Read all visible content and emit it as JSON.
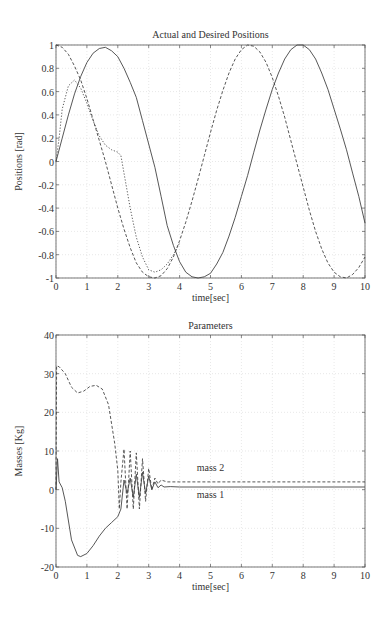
{
  "chart_data": [
    {
      "type": "line",
      "title": "Actual and Desired Positions",
      "xlabel": "time[sec]",
      "ylabel": "Positions [rad]",
      "xlim": [
        0,
        10
      ],
      "ylim": [
        -1,
        1
      ],
      "xticks": [
        "0",
        "1",
        "2",
        "3",
        "4",
        "5",
        "6",
        "7",
        "8",
        "9",
        "10"
      ],
      "yticks": [
        "-1",
        "-0.8",
        "-0.6",
        "-0.4",
        "-0.2",
        "0",
        "0.2",
        "0.4",
        "0.6",
        "0.8",
        "1"
      ],
      "grid": true,
      "series": [
        {
          "name": "actual position 1",
          "style": "solid",
          "x": [
            0,
            0.2,
            0.4,
            0.6,
            0.8,
            1.0,
            1.2,
            1.4,
            1.6,
            1.8,
            2.0,
            2.2,
            2.4,
            2.6,
            2.8,
            3.0,
            3.2,
            3.4,
            3.6,
            3.8,
            4.0,
            4.2,
            4.4,
            4.6,
            4.8,
            5.0,
            5.2,
            5.4,
            5.6,
            5.8,
            6.0,
            6.2,
            6.4,
            6.6,
            6.8,
            7.0,
            7.2,
            7.4,
            7.6,
            7.8,
            8.0,
            8.2,
            8.4,
            8.6,
            8.8,
            9.0,
            9.2,
            9.4,
            9.6,
            9.8,
            10.0
          ],
          "y": [
            0,
            0.2,
            0.4,
            0.58,
            0.73,
            0.85,
            0.93,
            0.97,
            0.98,
            0.95,
            0.9,
            0.8,
            0.68,
            0.55,
            0.35,
            0.15,
            -0.05,
            -0.3,
            -0.55,
            -0.72,
            -0.86,
            -0.95,
            -0.99,
            -1.0,
            -0.99,
            -0.96,
            -0.88,
            -0.78,
            -0.64,
            -0.48,
            -0.3,
            -0.12,
            0.08,
            0.27,
            0.45,
            0.62,
            0.76,
            0.88,
            0.96,
            1.0,
            1.0,
            0.96,
            0.88,
            0.76,
            0.62,
            0.45,
            0.28,
            0.1,
            -0.1,
            -0.3,
            -0.53
          ]
        },
        {
          "name": "desired position 1",
          "style": "dashed",
          "x": [
            0,
            0.2,
            0.4,
            0.6,
            0.8,
            1.0,
            1.2,
            1.4,
            1.6,
            1.8,
            2.0,
            2.2,
            2.4,
            2.6,
            2.8,
            3.0,
            3.2,
            3.4,
            3.6,
            3.8,
            4.0,
            4.2,
            4.4,
            4.6,
            4.8,
            5.0,
            5.2,
            5.4,
            5.6,
            5.8,
            6.0,
            6.2,
            6.4,
            6.6,
            6.8,
            7.0,
            7.2,
            7.4,
            7.6,
            7.8,
            8.0,
            8.2,
            8.4,
            8.6,
            8.8,
            9.0,
            9.2,
            9.4,
            9.6,
            9.8,
            10.0
          ],
          "y": [
            1.0,
            0.98,
            0.92,
            0.82,
            0.7,
            0.54,
            0.36,
            0.18,
            0.0,
            -0.2,
            -0.4,
            -0.58,
            -0.74,
            -0.87,
            -0.95,
            -0.99,
            -1.0,
            -0.98,
            -0.92,
            -0.82,
            -0.68,
            -0.52,
            -0.34,
            -0.15,
            0.05,
            0.25,
            0.44,
            0.61,
            0.76,
            0.88,
            0.96,
            1.0,
            0.99,
            0.94,
            0.85,
            0.72,
            0.56,
            0.38,
            0.18,
            -0.02,
            -0.22,
            -0.42,
            -0.6,
            -0.75,
            -0.87,
            -0.95,
            -0.99,
            -1.0,
            -0.97,
            -0.91,
            -0.82
          ]
        },
        {
          "name": "actual position 2",
          "style": "dotted",
          "x": [
            0,
            0.1,
            0.2,
            0.4,
            0.6,
            0.8,
            1.0,
            1.2,
            1.4,
            1.6,
            1.8,
            2.0,
            2.1,
            2.2,
            2.4,
            2.6,
            2.8,
            3.0,
            3.2,
            3.4,
            3.6,
            3.8,
            4.0
          ],
          "y": [
            0,
            0.2,
            0.45,
            0.65,
            0.7,
            0.63,
            0.5,
            0.35,
            0.22,
            0.14,
            0.1,
            0.08,
            0.05,
            -0.1,
            -0.4,
            -0.65,
            -0.82,
            -0.93,
            -0.95,
            -0.93,
            -0.88,
            -0.8,
            -0.7
          ]
        }
      ]
    },
    {
      "type": "line",
      "title": "Parameters",
      "xlabel": "time[sec]",
      "ylabel": "Masses [Kg]",
      "xlim": [
        0,
        10
      ],
      "ylim": [
        -20,
        40
      ],
      "xticks": [
        "0",
        "1",
        "2",
        "3",
        "4",
        "5",
        "6",
        "7",
        "8",
        "9",
        "10"
      ],
      "yticks": [
        "-20",
        "-10",
        "0",
        "10",
        "20",
        "30",
        "40"
      ],
      "grid": true,
      "annotations": [
        {
          "text": "mass 2",
          "x": 5,
          "y": 5.5
        },
        {
          "text": "mass 1",
          "x": 5,
          "y": -1.5
        }
      ],
      "series": [
        {
          "name": "mass 1",
          "style": "solid",
          "x": [
            0,
            0.05,
            0.1,
            0.2,
            0.3,
            0.5,
            0.7,
            0.8,
            1.0,
            1.2,
            1.4,
            1.6,
            1.8,
            2.0,
            2.1,
            2.2,
            2.3,
            2.4,
            2.5,
            2.6,
            2.7,
            2.8,
            2.9,
            3.0,
            3.1,
            3.2,
            3.3,
            3.4,
            3.5,
            3.7,
            4.0,
            5.0,
            6.0,
            7.0,
            8.0,
            9.0,
            10.0
          ],
          "y": [
            0,
            8,
            2,
            0.5,
            -3,
            -13,
            -17,
            -17.3,
            -16.5,
            -14.5,
            -12,
            -10,
            -8.5,
            -7,
            -5,
            2.5,
            -1,
            3,
            -2,
            4,
            -2,
            4.5,
            -1,
            3.5,
            0,
            2,
            0.5,
            1.2,
            0.7,
            0.8,
            0.7,
            0.7,
            0.7,
            0.7,
            0.7,
            0.7,
            0.7
          ]
        },
        {
          "name": "mass 2",
          "style": "dashed",
          "x": [
            0,
            0.02,
            0.1,
            0.3,
            0.5,
            0.7,
            0.9,
            1.1,
            1.3,
            1.5,
            1.7,
            1.9,
            2.0,
            2.05,
            2.1,
            2.2,
            2.3,
            2.4,
            2.5,
            2.6,
            2.7,
            2.8,
            2.9,
            3.0,
            3.1,
            3.2,
            3.3,
            3.4,
            3.6,
            4.0,
            5.0,
            6.0,
            7.0,
            8.0,
            9.0,
            10.0
          ],
          "y": [
            0,
            32,
            31.8,
            30,
            26.5,
            25,
            25.5,
            26.7,
            27,
            26,
            22,
            12,
            5,
            -5,
            2,
            10.5,
            -5,
            10,
            -5,
            9.5,
            -5,
            8,
            -3,
            5.5,
            0,
            3,
            1.5,
            2.5,
            2,
            2,
            2,
            2,
            2,
            2,
            2,
            2
          ]
        }
      ]
    }
  ]
}
